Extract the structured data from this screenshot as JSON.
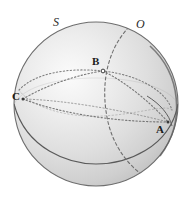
{
  "figure": {
    "kind": "sphere-diagram",
    "background_color": "#ffffff"
  },
  "sphere": {
    "center_x": 96,
    "center_y": 104,
    "radius": 82,
    "fill_light": "#f2f2f2",
    "fill_mid": "#d8d8d8",
    "fill_dark": "#b8b8b8",
    "outline_color": "#6e6e6e",
    "rim_color": "#555555",
    "highlight_x": 62,
    "highlight_y": 78
  },
  "labels": {
    "S": "S",
    "O": "O",
    "A": "A",
    "B": "B",
    "C": "C"
  },
  "points": {
    "A": {
      "name": "A",
      "x": 168,
      "y": 122
    },
    "B": {
      "name": "B",
      "x": 103,
      "y": 71
    },
    "C": {
      "name": "C",
      "x": 23,
      "y": 99
    }
  },
  "curves": {
    "equator": {
      "name": "equator",
      "style": "solid",
      "color": "#5a5a5a"
    },
    "meridian": {
      "name": "meridian-great-circle",
      "style": "dashed",
      "color": "#707070"
    },
    "small_circle": {
      "name": "small-circle-through-B",
      "style": "dotted",
      "color": "#7a7a7a"
    },
    "arc_BC": {
      "name": "arc-B-to-C",
      "style": "dotted",
      "color": "#7a7a7a"
    },
    "arc_BA": {
      "name": "arc-B-to-A",
      "style": "dotted",
      "color": "#7a7a7a"
    },
    "arc_CA": {
      "name": "arc-C-to-A",
      "style": "dotted",
      "color": "#7a7a7a"
    }
  }
}
